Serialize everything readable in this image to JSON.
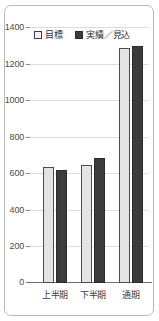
{
  "chart_data": {
    "type": "bar",
    "title": "",
    "xlabel": "",
    "ylabel": "",
    "categories": [
      "上半期",
      "下半期",
      "通期"
    ],
    "series": [
      {
        "name": "目標",
        "values": [
          634,
          645,
          1285
        ],
        "color": "#e3e3e3"
      },
      {
        "name": "実績／見込",
        "values": [
          618,
          683,
          1296
        ],
        "color": "#3b3b3b"
      }
    ],
    "ylim": [
      0,
      1400
    ],
    "yticks": [
      0,
      200,
      400,
      600,
      800,
      1000,
      1200,
      1400
    ],
    "ytick_labels": [
      "0",
      "200",
      "400",
      "600",
      "800",
      "1000",
      "1200",
      "1400"
    ],
    "grid": true,
    "legend_position": "top-left"
  },
  "legend": {
    "items": [
      {
        "label": "目標",
        "swatch": "light-square-swatch"
      },
      {
        "label": "実績／見込",
        "swatch": "dark-square-swatch"
      }
    ]
  },
  "axis": {
    "y_ticks": [
      "1400",
      "1200",
      "1000",
      "800",
      "600",
      "400",
      "200",
      "0"
    ],
    "x_labels": [
      "上半期",
      "下半期",
      "通期"
    ]
  }
}
